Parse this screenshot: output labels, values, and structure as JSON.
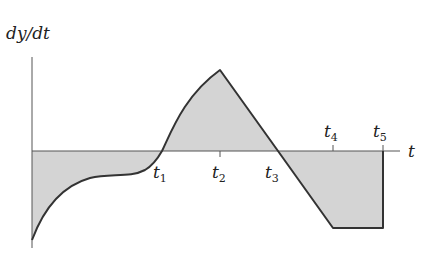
{
  "diagram": {
    "y_axis_label": "dy/dt",
    "x_axis_label": "t",
    "markers": [
      {
        "name": "t",
        "sub": "1"
      },
      {
        "name": "t",
        "sub": "2"
      },
      {
        "name": "t",
        "sub": "3"
      },
      {
        "name": "t",
        "sub": "4"
      },
      {
        "name": "t",
        "sub": "5"
      }
    ],
    "colors": {
      "fill": "#d4d4d4",
      "curve": "#333333",
      "axis": "#555555"
    }
  }
}
